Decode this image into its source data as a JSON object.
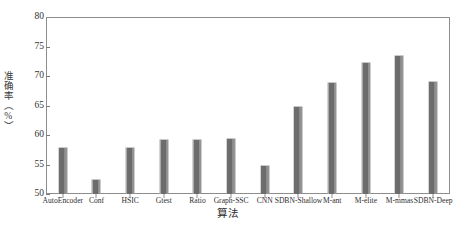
{
  "chart_data": {
    "type": "bar",
    "title": "",
    "xlabel": "算法",
    "ylabel": "准确率（%）",
    "ylim": [
      50,
      80
    ],
    "yticks": [
      50,
      55,
      60,
      65,
      70,
      75,
      80
    ],
    "ytick_labels": [
      "50",
      "55",
      "60",
      "65",
      "70",
      "75",
      "80"
    ],
    "grid": false,
    "legend": null,
    "bar_color": "#6b6b6b",
    "frame_color": "#8d8d8d",
    "categories": [
      "AutoEncoder",
      "Conf",
      "HSIC",
      "Gtest",
      "Ratio",
      "Graph-SSC",
      "CNN",
      "SDBN-Shallow",
      "M-ant",
      "M-elite",
      "M-mmas",
      "SDBN-Deep"
    ],
    "values": [
      58.0,
      52.5,
      58.0,
      59.3,
      59.3,
      59.5,
      55.0,
      65.0,
      69.0,
      72.3,
      73.5,
      69.2
    ]
  }
}
